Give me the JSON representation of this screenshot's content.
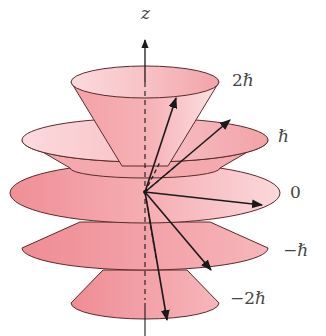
{
  "diagram": {
    "axis": {
      "label": "z"
    },
    "levels": [
      {
        "m": 2,
        "label": "2ℏ"
      },
      {
        "m": 1,
        "label": "ℏ"
      },
      {
        "m": 0,
        "label": "0"
      },
      {
        "m": -1,
        "label": "−ℏ"
      },
      {
        "m": -2,
        "label": "−2ℏ"
      }
    ],
    "colors": {
      "cone_dark": "#ef8f97",
      "cone_light": "#fbe0e2",
      "outline": "#5a2a2a",
      "arrow": "#1a1a1a",
      "label": "#444444"
    }
  }
}
